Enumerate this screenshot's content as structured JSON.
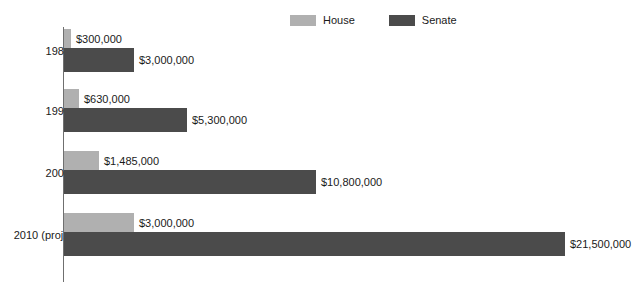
{
  "colors": {
    "house": "#b0b0b0",
    "senate": "#4b4b4b",
    "axis": "#6f6f6f",
    "text": "#1a1a1a",
    "background": "#ffffff"
  },
  "legend": {
    "items": [
      {
        "label": "House",
        "color_key": "house"
      },
      {
        "label": "Senate",
        "color_key": "senate"
      }
    ]
  },
  "chart_data": {
    "type": "bar",
    "orientation": "horizontal",
    "title": "",
    "subtitle": "",
    "xlabel": "",
    "ylabel": "",
    "grid": false,
    "legend_position": "top-center",
    "categories": [
      "1980",
      "1990",
      "2000",
      "2010 (proj.)"
    ],
    "xlim": [
      0,
      21500000
    ],
    "series": [
      {
        "name": "House",
        "color": "#b0b0b0",
        "values": [
          300000,
          630000,
          1485000,
          3000000
        ],
        "labels": [
          "$300,000",
          "$630,000",
          "$1,485,000",
          "$3,000,000"
        ]
      },
      {
        "name": "Senate",
        "color": "#4b4b4b",
        "values": [
          3000000,
          5300000,
          10800000,
          21500000
        ],
        "labels": [
          "$3,000,000",
          "$5,300,000",
          "$10,800,000",
          "$21,500,000"
        ]
      }
    ]
  },
  "groups": [
    {
      "label": "1980",
      "house": {
        "label": "$300,000",
        "value": 300000
      },
      "senate": {
        "label": "$3,000,000",
        "value": 3000000
      }
    },
    {
      "label": "1990",
      "house": {
        "label": "$630,000",
        "value": 630000
      },
      "senate": {
        "label": "$5,300,000",
        "value": 5300000
      }
    },
    {
      "label": "2000",
      "house": {
        "label": "$1,485,000",
        "value": 1485000
      },
      "senate": {
        "label": "$10,800,000",
        "value": 10800000
      }
    },
    {
      "label": "2010 (proj.)",
      "house": {
        "label": "$3,000,000",
        "value": 3000000
      },
      "senate": {
        "label": "$21,500,000",
        "value": 21500000
      }
    }
  ],
  "layout": {
    "axis_x": 63,
    "axis_top": 27,
    "axis_height": 255,
    "bar_start_x": 64,
    "px_per_dollar": 2.33e-05,
    "group_tops": [
      29,
      89,
      151,
      213
    ],
    "bar_heights": [
      19,
      24
    ],
    "label_offset": 5
  }
}
